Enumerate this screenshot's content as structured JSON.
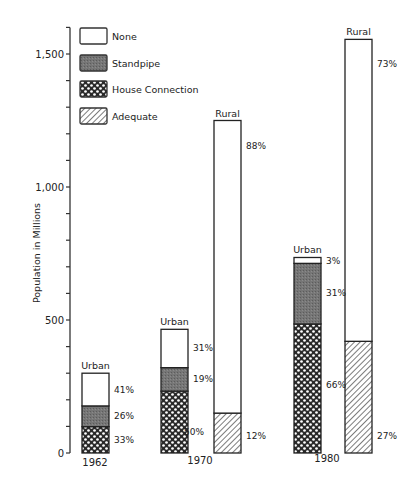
{
  "chart_data": {
    "type": "bar",
    "stacked": true,
    "title": "",
    "xlabel": "",
    "ylabel": "Population in Millions",
    "ylim": [
      0,
      1600
    ],
    "yticks_labeled": [
      0,
      500,
      1000,
      1500
    ],
    "yticks_labels": [
      "0",
      "500",
      "1,000",
      "1,500"
    ],
    "ytick_minor_step": 100,
    "grid": false,
    "legend_position": "top-left",
    "legend": [
      {
        "key": "none",
        "label": "None"
      },
      {
        "key": "standpipe",
        "label": "Standpipe"
      },
      {
        "key": "house",
        "label": "House Connection"
      },
      {
        "key": "adequate",
        "label": "Adequate"
      }
    ],
    "groups": [
      {
        "year": "1962",
        "bars": [
          {
            "label": "Urban",
            "total": 300,
            "segments": [
              {
                "key": "house",
                "pct": 33,
                "pct_label": "33%"
              },
              {
                "key": "standpipe",
                "pct": 26,
                "pct_label": "26%"
              },
              {
                "key": "none",
                "pct": 41,
                "pct_label": "41%"
              }
            ]
          }
        ]
      },
      {
        "year": "1970",
        "bars": [
          {
            "label": "Urban",
            "total": 465,
            "segments": [
              {
                "key": "house",
                "pct": 50,
                "pct_label": "50%"
              },
              {
                "key": "standpipe",
                "pct": 19,
                "pct_label": "19%"
              },
              {
                "key": "none",
                "pct": 31,
                "pct_label": "31%"
              }
            ]
          },
          {
            "label": "Rural",
            "total": 1250,
            "segments": [
              {
                "key": "adequate",
                "pct": 12,
                "pct_label": "12%"
              },
              {
                "key": "none",
                "pct": 88,
                "pct_label": "88%"
              }
            ]
          }
        ]
      },
      {
        "year": "1980",
        "bars": [
          {
            "label": "Urban",
            "total": 735,
            "segments": [
              {
                "key": "house",
                "pct": 66,
                "pct_label": "66%"
              },
              {
                "key": "standpipe",
                "pct": 31,
                "pct_label": "31%"
              },
              {
                "key": "none",
                "pct": 3,
                "pct_label": "3%"
              }
            ]
          },
          {
            "label": "Rural",
            "total": 1555,
            "segments": [
              {
                "key": "adequate",
                "pct": 27,
                "pct_label": "27%"
              },
              {
                "key": "none",
                "pct": 73,
                "pct_label": "73%"
              }
            ]
          }
        ]
      }
    ]
  }
}
